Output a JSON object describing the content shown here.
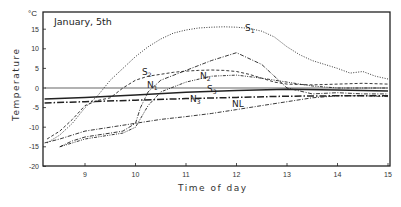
{
  "chart_data": {
    "type": "line",
    "title": "January, 5th",
    "xlabel": "Time of day",
    "ylabel": "Temperature",
    "yunit": "°C",
    "xlim": [
      8.2,
      15
    ],
    "ylim": [
      -20,
      18
    ],
    "xticks": [
      9,
      10,
      11,
      12,
      13,
      14,
      15
    ],
    "yticks": [
      15,
      10,
      5,
      0,
      -5,
      -10,
      -15,
      -20
    ],
    "grid": false,
    "legend": "inline labels on curves",
    "series": [
      {
        "name": "S1",
        "label_main": "S",
        "label_sub": "1",
        "style": "dotted",
        "x": [
          8.25,
          8.5,
          8.75,
          9.0,
          9.25,
          9.5,
          9.75,
          10.0,
          10.25,
          10.5,
          10.75,
          11.0,
          11.25,
          11.5,
          11.75,
          12.0,
          12.25,
          12.5,
          12.75,
          13.0,
          13.25,
          13.5,
          13.75,
          14.0,
          14.25,
          14.5,
          14.75,
          15.0
        ],
        "y": [
          -14,
          -12,
          -9,
          -5,
          -2,
          2,
          5,
          8,
          10.5,
          12.5,
          14,
          14.8,
          15.3,
          15.5,
          15.6,
          15.5,
          15.2,
          14.5,
          13,
          10.5,
          8.5,
          7,
          6,
          5,
          3.8,
          4.2,
          3,
          2.3
        ]
      },
      {
        "name": "S2",
        "label_main": "S",
        "label_sub": "2",
        "style": "dashed",
        "x": [
          8.25,
          8.5,
          8.75,
          9.0,
          9.25,
          9.5,
          9.75,
          10.0,
          10.25,
          10.5,
          10.75,
          11.0,
          11.25,
          11.5,
          11.75,
          12.0,
          12.25,
          12.5,
          12.75,
          13.0,
          13.5,
          14.0,
          14.5,
          15.0
        ],
        "y": [
          -13,
          -11,
          -8,
          -4.5,
          -3.2,
          -2.5,
          0,
          2,
          3,
          3.5,
          4,
          4.3,
          4.5,
          4.6,
          4.5,
          4.2,
          3.5,
          2.5,
          1.5,
          1,
          0.8,
          1,
          1.2,
          1
        ]
      },
      {
        "name": "S3",
        "label_main": "S",
        "label_sub": "3",
        "style": "solid",
        "x": [
          8.2,
          9.0,
          10.0,
          11.0,
          12.0,
          13.0,
          14.0,
          15.0
        ],
        "y": [
          -2.8,
          -2.4,
          -1.8,
          -1.1,
          -0.6,
          -0.3,
          -0.5,
          -0.8
        ]
      },
      {
        "name": "N1",
        "label_main": "N",
        "label_sub": "1",
        "style": "dash-dot",
        "x": [
          8.5,
          8.75,
          9.0,
          9.25,
          9.5,
          9.75,
          10.0,
          10.1,
          10.25,
          10.5,
          11.0,
          11.5,
          12.0,
          12.5,
          13.0,
          13.5,
          14.0,
          14.5,
          15.0
        ],
        "y": [
          -15,
          -13.5,
          -12.5,
          -12,
          -11.5,
          -11,
          -9,
          -5,
          -1,
          2,
          4.5,
          7,
          9,
          6,
          0,
          -1.5,
          -1.2,
          -1.5,
          -1.5
        ]
      },
      {
        "name": "N2",
        "label_main": "N",
        "label_sub": "2",
        "style": "dash-dot-dot",
        "x": [
          8.5,
          8.75,
          9.0,
          9.25,
          9.5,
          9.75,
          10.0,
          10.25,
          10.5,
          11.0,
          11.5,
          12.0,
          12.5,
          13.0,
          13.5,
          14.0,
          14.5,
          15.0
        ],
        "y": [
          -15,
          -14,
          -13,
          -12.5,
          -12,
          -11.5,
          -10,
          -4.5,
          -1,
          1.5,
          3,
          3.3,
          2.5,
          1.5,
          0.5,
          0,
          0,
          0
        ]
      },
      {
        "name": "N3",
        "label_main": "N",
        "label_sub": "3",
        "style": "long-dash-dot",
        "x": [
          8.2,
          9.0,
          10.0,
          11.0,
          12.0,
          13.0,
          14.0,
          15.0
        ],
        "y": [
          -3.8,
          -3.5,
          -3.1,
          -2.7,
          -2.4,
          -2.1,
          -2.0,
          -2.0
        ]
      },
      {
        "name": "NL",
        "label_main": "NL",
        "label_sub": "",
        "style": "dash-dot",
        "x": [
          8.2,
          8.5,
          9.0,
          9.5,
          10.0,
          10.5,
          11.0,
          11.5,
          12.0,
          12.5,
          13.0,
          13.5,
          14.0,
          14.5,
          15.0
        ],
        "y": [
          -14,
          -13,
          -11,
          -10,
          -9,
          -8,
          -7.3,
          -6.5,
          -5.5,
          -4.5,
          -3.5,
          -2.5,
          -2,
          -2,
          -2.2
        ]
      },
      {
        "name": "zero-reference",
        "label_main": "",
        "label_sub": "",
        "style": "thin-solid",
        "x": [
          8.2,
          15.0
        ],
        "y": [
          0,
          0
        ]
      }
    ]
  }
}
